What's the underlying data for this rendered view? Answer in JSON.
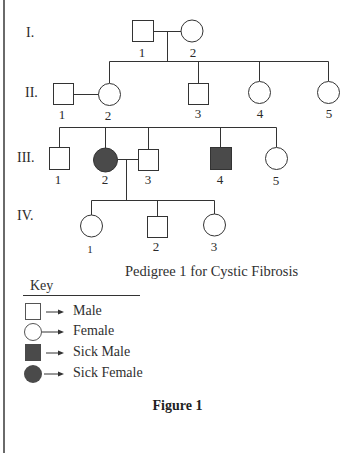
{
  "diagram": {
    "type": "pedigree",
    "title": "Pedigree 1 for Cystic Fibrosis",
    "figure_label": "Figure 1",
    "colors": {
      "line": "#333333",
      "affected_fill": "#4a4a4a",
      "unaffected_fill": "#ffffff",
      "border": "#6a6a6a"
    },
    "generations": [
      {
        "label": "I.",
        "individuals": [
          {
            "id": "I-1",
            "number": "1",
            "sex": "male",
            "affected": false
          },
          {
            "id": "I-2",
            "number": "2",
            "sex": "female",
            "affected": false
          }
        ]
      },
      {
        "label": "II.",
        "individuals": [
          {
            "id": "II-1",
            "number": "1",
            "sex": "male",
            "affected": false,
            "note": "married-in spouse of II-2"
          },
          {
            "id": "II-2",
            "number": "2",
            "sex": "female",
            "affected": false
          },
          {
            "id": "II-3",
            "number": "3",
            "sex": "male",
            "affected": false
          },
          {
            "id": "II-4",
            "number": "4",
            "sex": "female",
            "affected": false
          },
          {
            "id": "II-5",
            "number": "5",
            "sex": "female",
            "affected": false
          }
        ]
      },
      {
        "label": "III.",
        "individuals": [
          {
            "id": "III-1",
            "number": "1",
            "sex": "male",
            "affected": false
          },
          {
            "id": "III-2",
            "number": "2",
            "sex": "female",
            "affected": true
          },
          {
            "id": "III-3",
            "number": "3",
            "sex": "male",
            "affected": false
          },
          {
            "id": "III-4",
            "number": "4",
            "sex": "male",
            "affected": true
          },
          {
            "id": "III-5",
            "number": "5",
            "sex": "female",
            "affected": false
          }
        ]
      },
      {
        "label": "IV.",
        "individuals": [
          {
            "id": "IV-1",
            "number": "1",
            "sex": "female",
            "affected": false
          },
          {
            "id": "IV-2",
            "number": "2",
            "sex": "male",
            "affected": false
          },
          {
            "id": "IV-3",
            "number": "3",
            "sex": "female",
            "affected": false
          }
        ]
      }
    ],
    "relationships": [
      {
        "type": "mating",
        "partners": [
          "I-1",
          "I-2"
        ],
        "children": [
          "II-2",
          "II-3",
          "II-4",
          "II-5"
        ]
      },
      {
        "type": "mating",
        "partners": [
          "II-1",
          "II-2"
        ],
        "children": [
          "III-1",
          "III-2",
          "III-3",
          "III-4",
          "III-5"
        ]
      },
      {
        "type": "mating",
        "partners": [
          "III-2",
          "III-3"
        ],
        "children": [
          "IV-1",
          "IV-2",
          "IV-3"
        ]
      }
    ]
  },
  "key": {
    "title": "Key",
    "items": [
      {
        "symbol": "square-outline",
        "label": "Male"
      },
      {
        "symbol": "circle-outline",
        "label": "Female"
      },
      {
        "symbol": "square-filled",
        "label": "Sick Male"
      },
      {
        "symbol": "circle-filled",
        "label": "Sick Female"
      }
    ]
  }
}
